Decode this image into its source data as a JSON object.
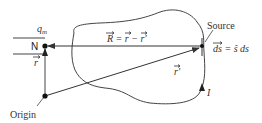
{
  "diagram": {
    "labels": {
      "charge": "q",
      "charge_sub": "m",
      "field_point": "N",
      "position_vector": "r",
      "origin": "Origin",
      "source": "Source",
      "separation_eq_R": "R",
      "separation_eq_rest": " = r − r′",
      "source_vector": "r′",
      "element_ds": "ds",
      "element_rest": " = ŝ ds",
      "current": "I"
    },
    "colors": {
      "line": "#444444",
      "text": "#333333",
      "background": "#ffffff"
    }
  }
}
